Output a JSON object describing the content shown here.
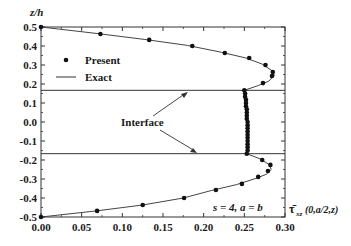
{
  "chart_data": {
    "type": "scatter",
    "title": "",
    "xlabel": "τ̄xz(0,a/2,z)",
    "xlabel_parts": {
      "main": "τ̄",
      "sub": "xz",
      "args": "(0,a/2,z)"
    },
    "ylabel": "z/h",
    "xlim": [
      0.0,
      0.3
    ],
    "ylim": [
      -0.5,
      0.5
    ],
    "x_ticks": [
      "0.00",
      "0.05",
      "0.10",
      "0.15",
      "0.20",
      "0.25",
      "0.30"
    ],
    "y_ticks": [
      "0.5",
      "0.4",
      "0.3",
      "0.2",
      "0.1",
      "0.0",
      "-0.1",
      "-0.2",
      "-0.3",
      "-0.4",
      "-0.5"
    ],
    "grid": false,
    "legend_position": "upper-left",
    "annotations": {
      "params": "s = 4, a = b",
      "interface_label": "Interface",
      "interface_z": [
        0.1667,
        -0.1667
      ]
    },
    "series": [
      {
        "name": "Present",
        "style": "markers",
        "points": [
          [
            0.0,
            0.5
          ],
          [
            0.073,
            0.463
          ],
          [
            0.133,
            0.432
          ],
          [
            0.186,
            0.4
          ],
          [
            0.226,
            0.363
          ],
          [
            0.256,
            0.337
          ],
          [
            0.276,
            0.3
          ],
          [
            0.285,
            0.263
          ],
          [
            0.284,
            0.242
          ],
          [
            0.273,
            0.205
          ],
          [
            0.25,
            0.167
          ],
          [
            0.251,
            0.15
          ],
          [
            0.251,
            0.133
          ],
          [
            0.252,
            0.117
          ],
          [
            0.252,
            0.1
          ],
          [
            0.252,
            0.083
          ],
          [
            0.253,
            0.067
          ],
          [
            0.253,
            0.05
          ],
          [
            0.253,
            0.033
          ],
          [
            0.253,
            0.017
          ],
          [
            0.254,
            0.0
          ],
          [
            0.254,
            -0.017
          ],
          [
            0.254,
            -0.033
          ],
          [
            0.254,
            -0.05
          ],
          [
            0.254,
            -0.067
          ],
          [
            0.254,
            -0.083
          ],
          [
            0.254,
            -0.1
          ],
          [
            0.254,
            -0.117
          ],
          [
            0.254,
            -0.133
          ],
          [
            0.254,
            -0.15
          ],
          [
            0.253,
            -0.167
          ],
          [
            0.272,
            -0.2
          ],
          [
            0.282,
            -0.226
          ],
          [
            0.279,
            -0.258
          ],
          [
            0.267,
            -0.289
          ],
          [
            0.247,
            -0.326
          ],
          [
            0.215,
            -0.358
          ],
          [
            0.176,
            -0.4
          ],
          [
            0.125,
            -0.437
          ],
          [
            0.069,
            -0.468
          ],
          [
            0.0,
            -0.5
          ]
        ]
      },
      {
        "name": "Exact",
        "style": "line",
        "points": [
          [
            0.0,
            0.5
          ],
          [
            0.07,
            0.465
          ],
          [
            0.13,
            0.433
          ],
          [
            0.18,
            0.403
          ],
          [
            0.222,
            0.367
          ],
          [
            0.252,
            0.337
          ],
          [
            0.272,
            0.305
          ],
          [
            0.284,
            0.27
          ],
          [
            0.287,
            0.245
          ],
          [
            0.28,
            0.215
          ],
          [
            0.266,
            0.19
          ],
          [
            0.25,
            0.167
          ],
          [
            0.251,
            0.083
          ],
          [
            0.254,
            0.0
          ],
          [
            0.254,
            -0.083
          ],
          [
            0.253,
            -0.167
          ],
          [
            0.27,
            -0.195
          ],
          [
            0.281,
            -0.225
          ],
          [
            0.283,
            -0.25
          ],
          [
            0.277,
            -0.275
          ],
          [
            0.262,
            -0.3
          ],
          [
            0.24,
            -0.33
          ],
          [
            0.21,
            -0.36
          ],
          [
            0.175,
            -0.4
          ],
          [
            0.125,
            -0.437
          ],
          [
            0.068,
            -0.468
          ],
          [
            0.0,
            -0.5
          ]
        ]
      }
    ]
  },
  "legend": {
    "present": "Present",
    "exact": "Exact"
  },
  "labels": {
    "ylabel": "z/h",
    "x_main": "τ̄",
    "x_sub": "xz",
    "x_args": "(0,a/2,z)",
    "params": "s = 4, a = b",
    "interface": "Interface"
  }
}
